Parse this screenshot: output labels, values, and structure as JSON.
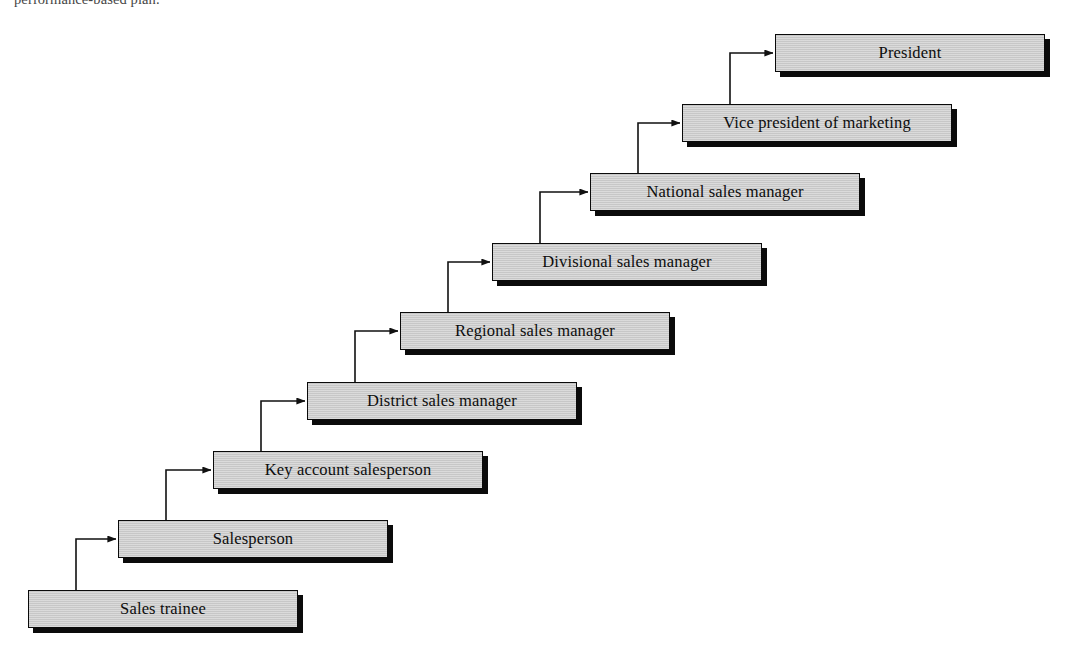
{
  "document": {
    "caption_fragment": "performance-based plan.",
    "title": "Sales career path"
  },
  "theme": {
    "page_background": "#ffffff",
    "box_fill": "#cbcbcb",
    "box_border": "#0a0a0a",
    "box_shadow": "#0b0b0b",
    "connector_color": "#111111",
    "text_color": "#0d0d0d"
  },
  "chart_data": {
    "type": "diagram",
    "diagram_style": "staircase-hierarchy",
    "direction": "ascending left-to-right, lowest rank at bottom-left",
    "node_count": 9,
    "nodes": [
      {
        "id": "sales-trainee",
        "label": "Sales trainee",
        "level": 1,
        "x": 28,
        "y": 590,
        "w": 270,
        "h": 38
      },
      {
        "id": "salesperson",
        "label": "Salesperson",
        "level": 2,
        "x": 118,
        "y": 520,
        "w": 270,
        "h": 38
      },
      {
        "id": "key-account",
        "label": "Key account salesperson",
        "level": 3,
        "x": 213,
        "y": 451,
        "w": 270,
        "h": 38
      },
      {
        "id": "district-manager",
        "label": "District sales manager",
        "level": 4,
        "x": 307,
        "y": 382,
        "w": 270,
        "h": 38
      },
      {
        "id": "regional-manager",
        "label": "Regional sales manager",
        "level": 5,
        "x": 400,
        "y": 312,
        "w": 270,
        "h": 38
      },
      {
        "id": "divisional-manager",
        "label": "Divisional sales manager",
        "level": 6,
        "x": 492,
        "y": 243,
        "w": 270,
        "h": 38
      },
      {
        "id": "national-manager",
        "label": "National sales manager",
        "level": 7,
        "x": 590,
        "y": 173,
        "w": 270,
        "h": 38
      },
      {
        "id": "vp-marketing",
        "label": "Vice president of marketing",
        "level": 8,
        "x": 682,
        "y": 104,
        "w": 270,
        "h": 38
      },
      {
        "id": "president",
        "label": "President",
        "level": 9,
        "x": 775,
        "y": 34,
        "w": 270,
        "h": 38
      }
    ],
    "edges": [
      {
        "from": "sales-trainee",
        "to": "salesperson",
        "style": "elbow-up-right",
        "arrow": "right-into-left-edge"
      },
      {
        "from": "salesperson",
        "to": "key-account",
        "style": "elbow-up-right",
        "arrow": "right-into-left-edge"
      },
      {
        "from": "key-account",
        "to": "district-manager",
        "style": "elbow-up-right",
        "arrow": "right-into-left-edge"
      },
      {
        "from": "district-manager",
        "to": "regional-manager",
        "style": "elbow-up-right",
        "arrow": "right-into-left-edge"
      },
      {
        "from": "regional-manager",
        "to": "divisional-manager",
        "style": "elbow-up-right",
        "arrow": "right-into-left-edge"
      },
      {
        "from": "divisional-manager",
        "to": "national-manager",
        "style": "elbow-up-right",
        "arrow": "right-into-left-edge"
      },
      {
        "from": "national-manager",
        "to": "vp-marketing",
        "style": "elbow-up-right",
        "arrow": "right-into-left-edge"
      },
      {
        "from": "vp-marketing",
        "to": "president",
        "style": "elbow-up-right",
        "arrow": "right-into-left-edge"
      }
    ]
  }
}
